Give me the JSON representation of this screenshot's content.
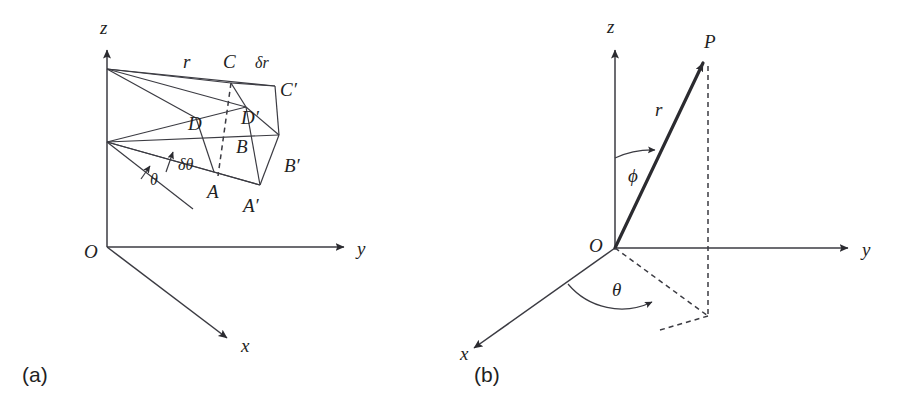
{
  "figure": {
    "background_color": "#ffffff",
    "line_color": "#3b3b42",
    "text_color": "#1f1f24"
  },
  "panels": [
    {
      "key": "a",
      "caption": "(a)",
      "description": "Spherical volume element wedge ABCD-A'B'C'D' with radial extent delta-r and angular extent delta-theta",
      "axes": [
        {
          "name": "z-axis",
          "label": "z"
        },
        {
          "name": "y-axis",
          "label": "y"
        },
        {
          "name": "x-axis",
          "label": "x"
        }
      ],
      "origin_label": "O",
      "measure_labels": [
        {
          "name": "radius",
          "label": "r"
        },
        {
          "name": "delta-r",
          "label": "δr"
        },
        {
          "name": "theta",
          "label": "θ"
        },
        {
          "name": "delta-theta",
          "label": "δθ"
        }
      ],
      "vertices": [
        {
          "name": "vertex-A",
          "label": "A"
        },
        {
          "name": "vertex-B",
          "label": "B"
        },
        {
          "name": "vertex-C",
          "label": "C"
        },
        {
          "name": "vertex-D",
          "label": "D"
        },
        {
          "name": "vertex-A-prime",
          "label": "A′"
        },
        {
          "name": "vertex-B-prime",
          "label": "B′"
        },
        {
          "name": "vertex-C-prime",
          "label": "C′"
        },
        {
          "name": "vertex-D-prime",
          "label": "D′"
        }
      ]
    },
    {
      "key": "b",
      "caption": "(b)",
      "description": "Point P located by radius r, polar angle phi from z-axis, azimuthal angle theta from x-axis",
      "axes": [
        {
          "name": "z-axis",
          "label": "z"
        },
        {
          "name": "y-axis",
          "label": "y"
        },
        {
          "name": "x-axis",
          "label": "x"
        }
      ],
      "origin_label": "O",
      "point_label": "P",
      "measure_labels": [
        {
          "name": "radius",
          "label": "r"
        },
        {
          "name": "phi",
          "label": "ϕ"
        },
        {
          "name": "theta",
          "label": "θ"
        }
      ]
    }
  ],
  "captions": {
    "panel_a": "(a)",
    "panel_b": "(b)"
  },
  "labels": {
    "a_z": "z",
    "a_y": "y",
    "a_x": "x",
    "a_O": "O",
    "a_r": "r",
    "a_dr": "δr",
    "a_theta": "θ",
    "a_dtheta": "δθ",
    "a_A": "A",
    "a_B": "B",
    "a_C": "C",
    "a_D": "D",
    "a_Ap": "A′",
    "a_Bp": "B′",
    "a_Cp": "C′",
    "a_Dp": "D′",
    "b_z": "z",
    "b_y": "y",
    "b_x": "x",
    "b_O": "O",
    "b_P": "P",
    "b_r": "r",
    "b_phi": "ϕ",
    "b_theta": "θ"
  }
}
